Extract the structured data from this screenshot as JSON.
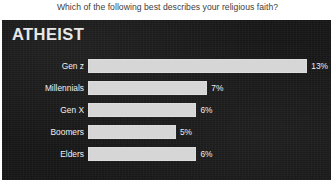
{
  "question": "Which of the following best describes your religious faith?",
  "panel": {
    "heading": "ATHEIST",
    "background_color": "#171717",
    "bar_color": "#d6d6d6",
    "text_color": "#f0f0f0"
  },
  "chart_data": {
    "type": "bar",
    "orientation": "horizontal",
    "title": "Which of the following best describes your religious faith?",
    "subtitle": "ATHEIST",
    "xlabel": "",
    "ylabel": "",
    "categories": [
      "Gen z",
      "Millennials",
      "Gen X",
      "Boomers",
      "Elders"
    ],
    "values": [
      13,
      7,
      6,
      5,
      6
    ],
    "value_labels": [
      "13%",
      "7%",
      "6%",
      "5%",
      "6%"
    ],
    "unit": "%",
    "xlim": [
      0,
      14.5
    ],
    "grid": false,
    "legend": null,
    "series": [
      {
        "name": "Atheist",
        "values": [
          13,
          7,
          6,
          5,
          6
        ]
      }
    ]
  },
  "rows": [
    {
      "label": "Gen z",
      "value": 13,
      "value_label": "13%",
      "bar_pct": 91.0
    },
    {
      "label": "Millennials",
      "value": 7,
      "value_label": "7%",
      "bar_pct": 49.5
    },
    {
      "label": "Gen X",
      "value": 6,
      "value_label": "6%",
      "bar_pct": 45.0
    },
    {
      "label": "Boomers",
      "value": 5,
      "value_label": "5%",
      "bar_pct": 36.5
    },
    {
      "label": "Elders",
      "value": 6,
      "value_label": "6%",
      "bar_pct": 45.0
    }
  ]
}
